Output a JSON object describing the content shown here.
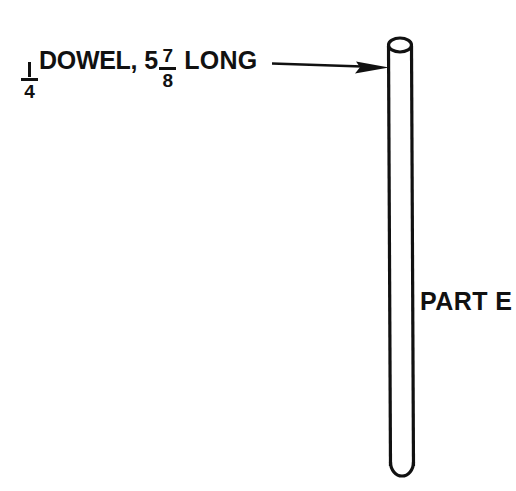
{
  "drawing": {
    "background_color": "#ffffff",
    "ink_color": "#111111",
    "callout": {
      "fraction_diameter": {
        "numerator": "1",
        "denominator": "4"
      },
      "material": "DOWEL,",
      "length_whole": "5",
      "fraction_length": {
        "numerator": "7",
        "denominator": "8"
      },
      "length_word": "LONG",
      "full_text": "1/4 DOWEL, 5 7/8 LONG"
    },
    "leader": {
      "start_x": 272,
      "start_y": 64,
      "end_x": 388,
      "end_y": 67,
      "arrowhead": "solid-triangle"
    },
    "part": {
      "label": "PART E",
      "shape": "cylindrical-rod",
      "top_cap": "ellipse",
      "bottom_cap": "rounded",
      "top_y": 38,
      "bottom_y": 479,
      "left_x": 388,
      "right_x": 412,
      "width_px": 24
    }
  }
}
